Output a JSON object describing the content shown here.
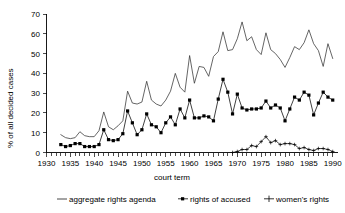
{
  "chart_data": {
    "type": "line",
    "title": "",
    "xlabel": "court term",
    "ylabel": "% of all decided cases",
    "xlim": [
      1930,
      1991
    ],
    "ylim": [
      0,
      70
    ],
    "grid": false,
    "legend_position": "bottom",
    "y_ticks": [
      0,
      10,
      20,
      30,
      40,
      50,
      60,
      70
    ],
    "x_ticks_labeled": [
      1930,
      1935,
      1940,
      1945,
      1950,
      1955,
      1960,
      1965,
      1970,
      1975,
      1980,
      1985,
      1990
    ],
    "x_tick_interval_minor": 1,
    "series": [
      {
        "name": "aggregate rights agenda",
        "marker": "none",
        "x": [
          1933,
          1934,
          1935,
          1936,
          1937,
          1938,
          1939,
          1940,
          1941,
          1942,
          1943,
          1944,
          1945,
          1946,
          1947,
          1948,
          1949,
          1950,
          1951,
          1952,
          1953,
          1954,
          1955,
          1956,
          1957,
          1958,
          1959,
          1960,
          1961,
          1962,
          1963,
          1964,
          1965,
          1966,
          1967,
          1968,
          1969,
          1970,
          1971,
          1972,
          1973,
          1974,
          1975,
          1976,
          1977,
          1978,
          1979,
          1980,
          1981,
          1982,
          1983,
          1984,
          1985,
          1986,
          1987,
          1988,
          1989,
          1990
        ],
        "values": [
          9.0,
          7.5,
          7.0,
          7.5,
          10.5,
          8.5,
          8.0,
          8.0,
          11.0,
          20.5,
          13.0,
          11.5,
          13.5,
          16.0,
          31.0,
          25.0,
          24.5,
          25.5,
          36.0,
          26.5,
          24.5,
          23.5,
          26.5,
          31.0,
          40.0,
          33.0,
          30.5,
          49.0,
          35.0,
          43.5,
          43.0,
          38.5,
          48.5,
          51.0,
          61.0,
          51.5,
          52.0,
          57.5,
          66.0,
          56.5,
          58.5,
          52.0,
          49.5,
          60.5,
          52.0,
          50.0,
          47.0,
          43.0,
          48.0,
          53.5,
          52.0,
          55.5,
          62.0,
          55.0,
          51.5,
          43.5,
          55.0,
          47.5
        ]
      },
      {
        "name": "rights of accused",
        "marker": "square",
        "x": [
          1933,
          1934,
          1935,
          1936,
          1937,
          1938,
          1939,
          1940,
          1941,
          1942,
          1943,
          1944,
          1945,
          1946,
          1947,
          1948,
          1949,
          1950,
          1951,
          1952,
          1953,
          1954,
          1955,
          1956,
          1957,
          1958,
          1959,
          1960,
          1961,
          1962,
          1963,
          1964,
          1965,
          1966,
          1967,
          1968,
          1969,
          1970,
          1971,
          1972,
          1973,
          1974,
          1975,
          1976,
          1977,
          1978,
          1979,
          1980,
          1981,
          1982,
          1983,
          1984,
          1985,
          1986,
          1987,
          1988,
          1989,
          1990
        ],
        "values": [
          4.0,
          3.0,
          3.5,
          4.5,
          4.5,
          3.0,
          3.0,
          3.0,
          4.0,
          11.5,
          6.5,
          6.0,
          6.5,
          9.5,
          21.0,
          15.0,
          9.0,
          11.5,
          19.5,
          14.0,
          13.0,
          10.0,
          15.0,
          18.0,
          14.0,
          22.0,
          17.5,
          26.5,
          17.5,
          17.5,
          18.5,
          18.0,
          16.0,
          27.0,
          37.0,
          30.5,
          19.5,
          29.5,
          22.5,
          21.5,
          22.0,
          22.0,
          22.5,
          26.0,
          22.5,
          24.0,
          22.5,
          16.0,
          22.0,
          28.0,
          26.5,
          30.5,
          29.0,
          19.0,
          25.0,
          30.5,
          28.0,
          26.5
        ]
      },
      {
        "name": "women's rights",
        "marker": "plus",
        "x": [
          1969,
          1970,
          1971,
          1972,
          1973,
          1974,
          1975,
          1976,
          1977,
          1978,
          1979,
          1980,
          1981,
          1982,
          1983,
          1984,
          1985,
          1986,
          1987,
          1988,
          1989,
          1990
        ],
        "values": [
          0.0,
          0.5,
          1.5,
          1.5,
          3.5,
          3.0,
          5.5,
          8.0,
          5.0,
          6.0,
          4.0,
          4.5,
          4.5,
          4.0,
          2.0,
          2.5,
          1.5,
          1.0,
          2.0,
          2.0,
          1.5,
          0.5
        ]
      }
    ],
    "legend": [
      {
        "label": "aggregate rights agenda",
        "marker": "line"
      },
      {
        "label": "rights of accused",
        "marker": "square"
      },
      {
        "label": "women's rights",
        "marker": "plus"
      }
    ]
  },
  "axis": {
    "y_label": "% of all decided cases",
    "x_label": "court term",
    "y_tick_labels": [
      "0",
      "10",
      "20",
      "30",
      "40",
      "50",
      "60",
      "70"
    ],
    "x_tick_labels": [
      "1930",
      "1935",
      "1940",
      "1945",
      "1950",
      "1955",
      "1960",
      "1965",
      "1970",
      "1975",
      "1980",
      "1985",
      "1990"
    ]
  },
  "legend": {
    "item0": "aggregate rights agenda",
    "item1": "rights of accused",
    "item2": "women's rights"
  },
  "colors": {
    "axis": "#000000",
    "aggregate": "#333333",
    "accused": "#000000",
    "women": "#000000",
    "background": "#ffffff"
  }
}
